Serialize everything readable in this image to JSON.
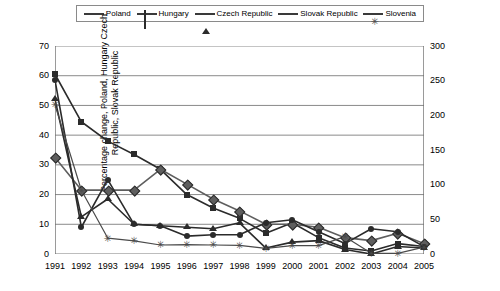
{
  "chart_data": {
    "type": "line",
    "title": "",
    "xlabel": "",
    "ylabel": "Percentage change, Poland, Hungary Czech Republic, Slovak Republic",
    "ylabel_right": "Percentage change, Slovenia",
    "grid": true,
    "legend_position": "top",
    "x": [
      1991,
      1992,
      1993,
      1994,
      1995,
      1996,
      1997,
      1998,
      1999,
      2000,
      2001,
      2002,
      2003,
      2004,
      2005
    ],
    "categories": [
      "1991",
      "1992",
      "1993",
      "1994",
      "1995",
      "1996",
      "1997",
      "1998",
      "1999",
      "2000",
      "2001",
      "2002",
      "2003",
      "2004",
      "2005"
    ],
    "ylim": [
      0,
      70
    ],
    "yticks": [
      0,
      10,
      20,
      30,
      40,
      50,
      60,
      70
    ],
    "ylim_right": [
      0,
      300
    ],
    "yticks_right": [
      0,
      50,
      100,
      150,
      200,
      250,
      300
    ],
    "series": [
      {
        "name": "Poland",
        "axis": "left",
        "marker": "square",
        "color": "#2b2b2b",
        "values": [
          60.5,
          44.5,
          38.0,
          33.5,
          28.5,
          20.0,
          15.5,
          12.0,
          7.0,
          10.5,
          5.5,
          2.0,
          1.0,
          3.5,
          2.5
        ]
      },
      {
        "name": "Hungary",
        "axis": "left",
        "marker": "diamond",
        "color": "#5e5e5e",
        "values": [
          32.5,
          21.5,
          21.5,
          21.5,
          28.5,
          23.5,
          18.5,
          14.5,
          10.0,
          10.0,
          9.0,
          5.5,
          4.5,
          7.0,
          3.5
        ]
      },
      {
        "name": "Czech Republic",
        "axis": "left",
        "marker": "triangle",
        "color": "#2b2b2b",
        "values": [
          52.0,
          12.5,
          18.5,
          10.0,
          9.5,
          9.0,
          8.5,
          10.5,
          2.0,
          4.0,
          4.5,
          1.5,
          0.0,
          2.5,
          2.0
        ]
      },
      {
        "name": "Slovak Republic",
        "axis": "left",
        "marker": "circle",
        "color": "#2b2b2b",
        "values": [
          58.5,
          9.0,
          25.0,
          10.0,
          9.5,
          6.0,
          6.5,
          6.5,
          10.5,
          11.5,
          7.5,
          3.5,
          8.5,
          7.5,
          2.5
        ]
      },
      {
        "name": "Slovenia",
        "axis": "right",
        "marker": "star",
        "color": "#4a4a4a",
        "values": [
          215.0,
          92.0,
          23.0,
          19.0,
          13.0,
          13.5,
          13.0,
          12.5,
          8.0,
          12.0,
          12.0,
          25.0,
          1.0,
          1.0,
          10.0
        ]
      }
    ]
  },
  "legend": {
    "items": [
      {
        "label": "Poland",
        "marker": "square"
      },
      {
        "label": "Hungary",
        "marker": "diamond"
      },
      {
        "label": "Czech Republic",
        "marker": "triangle"
      },
      {
        "label": "Slovak Republic",
        "marker": "circle"
      },
      {
        "label": "Slovenia",
        "marker": "star"
      }
    ]
  },
  "axes": {
    "left_title": "Percentage change, Poland, Hungary Czech Republic, Slovak Republic",
    "right_title": "Percentage change, Slovenia",
    "left_ticks": [
      "70",
      "60",
      "50",
      "40",
      "30",
      "20",
      "10",
      "0"
    ],
    "right_ticks": [
      "300",
      "250",
      "200",
      "150",
      "100",
      "50",
      "0"
    ],
    "x_ticks": [
      "1991",
      "1992",
      "1993",
      "1994",
      "1995",
      "1996",
      "1997",
      "1998",
      "1999",
      "2000",
      "2001",
      "2002",
      "2003",
      "2004",
      "2005"
    ]
  }
}
